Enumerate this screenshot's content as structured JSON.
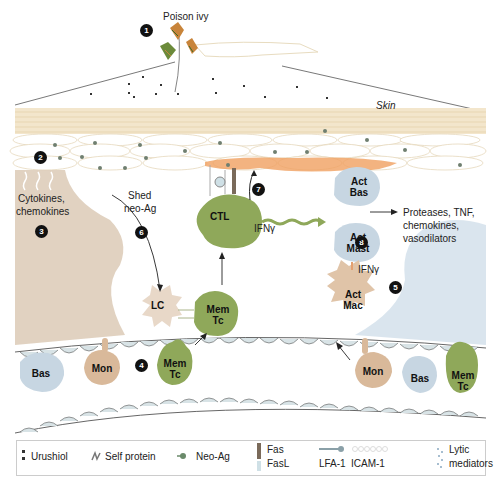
{
  "title": "Poison ivy",
  "skin_label": "Skin",
  "steps": [
    {
      "n": "1"
    },
    {
      "n": "2"
    },
    {
      "n": "3"
    },
    {
      "n": "4"
    },
    {
      "n": "5"
    },
    {
      "n": "6"
    },
    {
      "n": "7"
    },
    {
      "n": "8"
    }
  ],
  "labels": {
    "cytokines": "Cytokines,",
    "chemokines": "chemokines",
    "shed": "Shed",
    "neo_ag": "neo-Ag",
    "ifng_ctl": "IFNγ",
    "ifng_mac": "IFNγ",
    "products_1": "Proteases, TNF,",
    "products_2": "chemokines,",
    "products_3": "vasodilators"
  },
  "cells": {
    "ctl": "CTL",
    "act_bas_1": "Act",
    "act_bas_2": "Bas",
    "act_mast_1": "Act",
    "act_mast_2": "Mast",
    "act_mac_1": "Act",
    "act_mac_2": "Mac",
    "lc": "LC",
    "mem_tc_top_1": "Mem",
    "mem_tc_top_2": "Tc",
    "bas_left": "Bas",
    "mon_left": "Mon",
    "mem_tc_left_1": "Mem",
    "mem_tc_left_2": "Tc",
    "mon_right": "Mon",
    "bas_right": "Bas",
    "mem_tc_right_1": "Mem",
    "mem_tc_right_2": "Tc"
  },
  "legend": {
    "urushiol": "Urushiol",
    "self_protein": "Self protein",
    "neo_ag": "Neo-Ag",
    "fas": "Fas",
    "fasl": "FasL",
    "lfa1": "LFA-1",
    "icam1": "ICAM-1",
    "lytic_1": "Lytic",
    "lytic_2": "mediators"
  },
  "colors": {
    "skin_layer": "#f3e6cc",
    "inflammation": "#f0a060",
    "tc_green": "#8fa85a",
    "mon_tan": "#d9b99a",
    "bas_blue": "#c7d6e2",
    "tissue_tan": "#dccab6",
    "tissue_blue": "#d6e2ec"
  }
}
